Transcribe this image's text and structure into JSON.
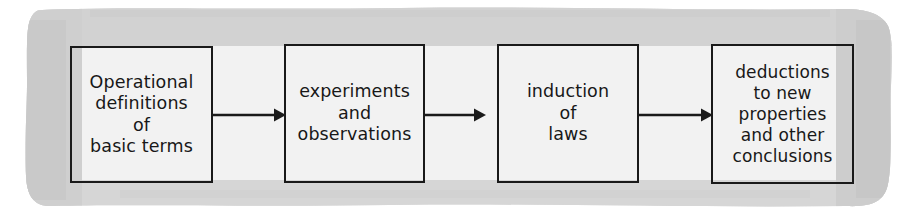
{
  "figure": {
    "background_color": "#ffffff",
    "highlight_band_color": "#d5d5d5",
    "box_border_color": "#1a1a1a",
    "text_color": "#181818",
    "arrow_color": "#1a1a1a"
  },
  "boxes": [
    {
      "id": "operational-definitions",
      "text": "Operational\ndefinitions\nof\nbasic terms",
      "lines": [
        "Operational",
        "definitions",
        "of",
        "basic terms"
      ]
    },
    {
      "id": "experiments-observations",
      "text": "experiments\nand\nobservations",
      "lines": [
        "experiments",
        "and",
        "observations"
      ]
    },
    {
      "id": "induction-of-laws",
      "text": "induction\nof\nlaws",
      "lines": [
        "induction",
        "of",
        "laws"
      ]
    },
    {
      "id": "deductions",
      "text": "deductions\nto new\nproperties\nand other\nconclusions",
      "lines": [
        "deductions",
        "to new",
        "properties",
        "and other",
        "conclusions"
      ]
    }
  ],
  "arrows": [
    {
      "id": "arrow-1",
      "from": "operational-definitions",
      "to": "experiments-observations",
      "direction": "right"
    },
    {
      "id": "arrow-2",
      "from": "experiments-observations",
      "to": "induction-of-laws",
      "direction": "right"
    },
    {
      "id": "arrow-3",
      "from": "induction-of-laws",
      "to": "deductions",
      "direction": "right"
    }
  ]
}
